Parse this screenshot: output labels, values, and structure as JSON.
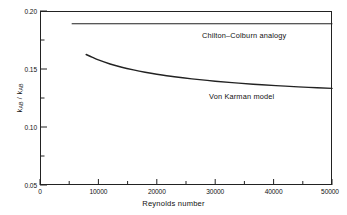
{
  "chart_data": {
    "type": "line",
    "title": "",
    "subtitle": "",
    "xlabel": "Reynolds number",
    "ylabel_text": "k",
    "ylabel_sub1": "AB",
    "ylabel_sep": " / k",
    "ylabel_sub2": "AB",
    "xlim": [
      0,
      50000
    ],
    "ylim": [
      0.05,
      0.2
    ],
    "grid": false,
    "legend_position": "inline-annotations",
    "xticks": [
      0,
      10000,
      20000,
      30000,
      40000,
      50000
    ],
    "xtick_labels": [
      "0",
      "10000",
      "20000",
      "30000",
      "40000",
      "50000"
    ],
    "yticks": [
      0.05,
      0.1,
      0.15,
      0.2
    ],
    "ytick_labels": [
      "0.05",
      "0.10",
      "0.15",
      "0.20"
    ],
    "yminorticks": [
      0.075,
      0.125,
      0.175
    ],
    "series": [
      {
        "name": "Chilton-Colburn analogy",
        "annotation": "Chilton–Colburn analogy",
        "x": [
          5500,
          10000,
          15000,
          20000,
          25000,
          30000,
          35000,
          40000,
          45000,
          50000
        ],
        "values": [
          0.189,
          0.189,
          0.189,
          0.189,
          0.189,
          0.189,
          0.189,
          0.189,
          0.189,
          0.189
        ]
      },
      {
        "name": "Von Karman model",
        "annotation": "Von Karman model",
        "x": [
          7900,
          9000,
          10000,
          12000,
          14000,
          16000,
          18000,
          20000,
          23000,
          26000,
          30000,
          34000,
          38000,
          42000,
          46000,
          50000
        ],
        "values": [
          0.1625,
          0.16,
          0.1578,
          0.1543,
          0.1515,
          0.1492,
          0.1472,
          0.1455,
          0.1433,
          0.1415,
          0.1395,
          0.1378,
          0.1364,
          0.1352,
          0.1342,
          0.1333
        ]
      }
    ]
  },
  "axes": {
    "x_tick_labels": [
      "0",
      "10000",
      "20000",
      "30000",
      "40000",
      "50000"
    ],
    "y_tick_labels": [
      "0.20",
      "0.15",
      "0.10",
      "0.05"
    ],
    "x_title": "Reynolds number"
  },
  "annotations": {
    "chilton": "Chilton–Colburn analogy",
    "von_karman": "Von Karman model"
  },
  "colors": {
    "line": "#222222",
    "frame": "#222222",
    "background": "#ffffff",
    "text": "#111111"
  }
}
